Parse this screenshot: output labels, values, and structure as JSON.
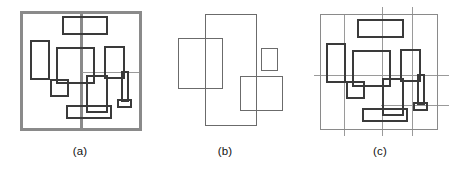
{
  "figure": {
    "width": 462,
    "height": 172,
    "background": "#ffffff"
  },
  "style": {
    "thick_stroke_color": "#3a3a3a",
    "thick_stroke_width": 2.0,
    "thin_stroke_color": "#6b6b6b",
    "thin_stroke_width": 1.0,
    "frame_stroke_color": "#8a8a8a",
    "frame_stroke_width": 3.0,
    "caption_color": "#111111",
    "caption_font_size": 11.5
  },
  "panels": [
    {
      "id": "a",
      "caption": "(a)",
      "caption_x": 80,
      "caption_y": 152,
      "frame": {
        "x": 21,
        "y": 12,
        "w": 119,
        "h": 117,
        "stroke": "#8a8a8a",
        "width": 3.0
      },
      "guides": [
        {
          "name": "vertical-thick-guide",
          "x1": 81,
          "y1": 12,
          "x2": 81,
          "y2": 129,
          "stroke": "#8a8a8a",
          "width": 2.5
        },
        {
          "name": "horizontal-thin-guide",
          "x1": 81,
          "y1": 72,
          "x2": 140,
          "y2": 72,
          "stroke": "#9a9a9a",
          "width": 1.0
        }
      ],
      "rects": [
        {
          "name": "rect-top-center",
          "x": 62,
          "y": 16,
          "w": 44,
          "h": 17,
          "stroke": "#3a3a3a",
          "width": 2.0
        },
        {
          "name": "rect-left-tall",
          "x": 30,
          "y": 40,
          "w": 18,
          "h": 38,
          "stroke": "#3a3a3a",
          "width": 2.0
        },
        {
          "name": "rect-center-large",
          "x": 56,
          "y": 47,
          "w": 37,
          "h": 35,
          "stroke": "#3a3a3a",
          "width": 2.0
        },
        {
          "name": "rect-right-upper",
          "x": 104,
          "y": 46,
          "w": 19,
          "h": 31,
          "stroke": "#3a3a3a",
          "width": 2.0
        },
        {
          "name": "rect-small-left",
          "x": 50,
          "y": 79,
          "w": 17,
          "h": 16,
          "stroke": "#3a3a3a",
          "width": 2.0
        },
        {
          "name": "rect-center-lower",
          "x": 86,
          "y": 75,
          "w": 20,
          "h": 36,
          "stroke": "#3a3a3a",
          "width": 2.0
        },
        {
          "name": "rect-wide-bottom",
          "x": 66,
          "y": 105,
          "w": 44,
          "h": 12,
          "stroke": "#3a3a3a",
          "width": 2.0
        },
        {
          "name": "rect-thin-vertical-post",
          "x": 121,
          "y": 71,
          "w": 6,
          "h": 29,
          "stroke": "#3a3a3a",
          "width": 2.0
        },
        {
          "name": "rect-post-base",
          "x": 117,
          "y": 99,
          "w": 13,
          "h": 7,
          "stroke": "#3a3a3a",
          "width": 2.0
        }
      ]
    },
    {
      "id": "b",
      "caption": "(b)",
      "caption_x": 225,
      "caption_y": 152,
      "frame": null,
      "guides": [],
      "rects": [
        {
          "name": "rect-tall-center",
          "x": 205,
          "y": 14,
          "w": 51,
          "h": 111,
          "stroke": "#6b6b6b",
          "width": 1.2
        },
        {
          "name": "rect-left-block",
          "x": 178,
          "y": 38,
          "w": 44,
          "h": 50,
          "stroke": "#6b6b6b",
          "width": 1.2
        },
        {
          "name": "rect-right-small",
          "x": 261,
          "y": 48,
          "w": 16,
          "h": 22,
          "stroke": "#6b6b6b",
          "width": 1.2
        },
        {
          "name": "rect-bottom-right",
          "x": 240,
          "y": 76,
          "w": 42,
          "h": 34,
          "stroke": "#6b6b6b",
          "width": 1.2
        }
      ]
    },
    {
      "id": "c",
      "caption": "(c)",
      "caption_x": 380,
      "caption_y": 152,
      "frame": {
        "x": 320,
        "y": 14,
        "w": 117,
        "h": 115,
        "stroke": "#8a8a8a",
        "width": 1.0
      },
      "guides": [
        {
          "name": "vertical-guide-left",
          "x1": 344,
          "y1": 14,
          "x2": 344,
          "y2": 135,
          "stroke": "#9a9a9a",
          "width": 1.0
        },
        {
          "name": "vertical-guide-center",
          "x1": 382,
          "y1": 6,
          "x2": 382,
          "y2": 135,
          "stroke": "#9a9a9a",
          "width": 1.0
        },
        {
          "name": "vertical-guide-right",
          "x1": 412,
          "y1": 6,
          "x2": 412,
          "y2": 135,
          "stroke": "#9a9a9a",
          "width": 1.0
        },
        {
          "name": "horizontal-guide-upper",
          "x1": 313,
          "y1": 75,
          "x2": 448,
          "y2": 75,
          "stroke": "#9a9a9a",
          "width": 1.0
        },
        {
          "name": "horizontal-guide-lower",
          "x1": 380,
          "y1": 105,
          "x2": 448,
          "y2": 105,
          "stroke": "#9a9a9a",
          "width": 1.0
        }
      ],
      "rects": [
        {
          "name": "rect-top-center",
          "x": 357,
          "y": 19,
          "w": 45,
          "h": 17,
          "stroke": "#3a3a3a",
          "width": 2.0
        },
        {
          "name": "rect-left-tall",
          "x": 326,
          "y": 43,
          "w": 18,
          "h": 38,
          "stroke": "#3a3a3a",
          "width": 2.0
        },
        {
          "name": "rect-center-large",
          "x": 352,
          "y": 50,
          "w": 37,
          "h": 35,
          "stroke": "#3a3a3a",
          "width": 2.0
        },
        {
          "name": "rect-right-upper",
          "x": 400,
          "y": 49,
          "w": 19,
          "h": 31,
          "stroke": "#3a3a3a",
          "width": 2.0
        },
        {
          "name": "rect-small-left",
          "x": 346,
          "y": 81,
          "w": 17,
          "h": 16,
          "stroke": "#3a3a3a",
          "width": 2.0
        },
        {
          "name": "rect-center-lower",
          "x": 382,
          "y": 78,
          "w": 20,
          "h": 36,
          "stroke": "#3a3a3a",
          "width": 2.0
        },
        {
          "name": "rect-wide-bottom",
          "x": 362,
          "y": 108,
          "w": 44,
          "h": 12,
          "stroke": "#3a3a3a",
          "width": 2.0
        },
        {
          "name": "rect-thin-vertical-post",
          "x": 417,
          "y": 74,
          "w": 6,
          "h": 29,
          "stroke": "#3a3a3a",
          "width": 2.0
        },
        {
          "name": "rect-post-base",
          "x": 413,
          "y": 102,
          "w": 13,
          "h": 7,
          "stroke": "#3a3a3a",
          "width": 2.0
        }
      ]
    }
  ]
}
